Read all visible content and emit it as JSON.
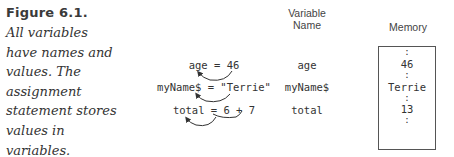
{
  "figure": {
    "title": "Figure 6.1.",
    "caption_lines": [
      "All variables",
      "have names and",
      "values. The",
      "assignment",
      "statement stores",
      "values in",
      "variables."
    ]
  },
  "statements": [
    {
      "text": "age = 46"
    },
    {
      "text": "myName$ = \"Terrie\""
    },
    {
      "text": "total = 6 + 7"
    }
  ],
  "variable_names": {
    "header_line1": "Variable",
    "header_line2": "Name",
    "items": [
      "age",
      "myName$",
      "total"
    ]
  },
  "memory": {
    "header": "Memory",
    "separator": ":",
    "values": [
      "46",
      "Terrie",
      "13"
    ]
  }
}
